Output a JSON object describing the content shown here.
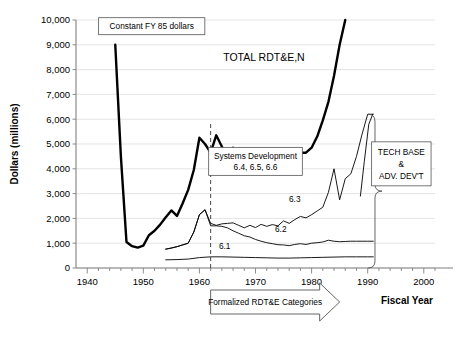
{
  "chart_data": {
    "type": "line",
    "title": "",
    "xlabel": "Fiscal Year",
    "ylabel": "Dollars (millions)",
    "xlim": [
      1938,
      2002
    ],
    "ylim": [
      0,
      10000
    ],
    "grid": true,
    "legend_position": "none",
    "xticks": [
      1940,
      1950,
      1960,
      1970,
      1980,
      1990,
      2000
    ],
    "xtick_labels": [
      "1940",
      "1950",
      "1960",
      "1970",
      "1980",
      "1990",
      "2000"
    ],
    "minor_xtick_interval": 2,
    "yticks": [
      0,
      1000,
      2000,
      3000,
      4000,
      5000,
      6000,
      7000,
      8000,
      9000,
      10000
    ],
    "ytick_labels": [
      "0",
      "1,000",
      "2,000",
      "3,000",
      "4,000",
      "5,000",
      "6,000",
      "7,000",
      "8,000",
      "9,000",
      "10,000"
    ],
    "annotations": [
      {
        "name": "constant-dollars-note",
        "text": "Constant FY 85 dollars",
        "x": 1951.5,
        "y": 9750
      },
      {
        "name": "total-series-label",
        "text": "TOTAL RDT&E,N",
        "x": 1971.5,
        "y": 8330
      },
      {
        "name": "systems-development-note",
        "text_line1": "Systems Development",
        "text_line2": "6.4, 6.5, 6.6",
        "x": 1970.0,
        "y": 4300
      },
      {
        "name": "tech-base-note",
        "text_line1": "TECH BASE",
        "text_line2": "&",
        "text_line3": "ADV. DEV'T",
        "x": 1996.0,
        "y": 4200
      },
      {
        "name": "formalized-categories-arrow",
        "text": "Formalized RDT&E Categories",
        "x": 1969.0,
        "y": -1100
      },
      {
        "name": "series-label-6-1",
        "text": "6.1",
        "x": 1964.5,
        "y": 780
      },
      {
        "name": "series-label-6-2",
        "text": "6.2",
        "x": 1974.5,
        "y": 1450
      },
      {
        "name": "series-label-6-3",
        "text": "6.3",
        "x": 1977.0,
        "y": 2680
      }
    ],
    "series": [
      {
        "name": "TOTAL RDT&E,N",
        "style": "thick",
        "x": [
          1945,
          1946,
          1947,
          1948,
          1949,
          1950,
          1951,
          1952,
          1953,
          1954,
          1955,
          1956,
          1957,
          1958,
          1959,
          1960,
          1961,
          1962,
          1963,
          1964,
          1965,
          1966,
          1967,
          1968,
          1969,
          1970,
          1971,
          1972,
          1973,
          1974,
          1975,
          1976,
          1977,
          1978,
          1979,
          1980,
          1981,
          1982,
          1983,
          1984,
          1985,
          1986
        ],
        "y": [
          9000,
          4500,
          1050,
          880,
          820,
          900,
          1320,
          1500,
          1750,
          2050,
          2320,
          2100,
          2600,
          3150,
          3950,
          5250,
          5000,
          4650,
          5350,
          4900,
          4500,
          4850,
          4200,
          4300,
          3900,
          4200,
          4300,
          4400,
          4250,
          4150,
          4200,
          4250,
          4500,
          4650,
          4650,
          4850,
          5300,
          5950,
          6700,
          7750,
          9000,
          10000
        ]
      },
      {
        "name": "6.3",
        "style": "thin",
        "x": [
          1954,
          1955,
          1956,
          1957,
          1958,
          1959,
          1960,
          1961,
          1962,
          1963,
          1964,
          1965,
          1966,
          1967,
          1968,
          1969,
          1970,
          1971,
          1972,
          1973,
          1974,
          1975,
          1976,
          1977,
          1978,
          1979,
          1980,
          1981,
          1982,
          1983,
          1984,
          1985,
          1986,
          1987,
          1988,
          1989,
          1990,
          1991
        ],
        "y": [
          760,
          800,
          860,
          930,
          1000,
          1450,
          2150,
          2350,
          1800,
          1720,
          1780,
          1800,
          1820,
          1720,
          1620,
          1720,
          1630,
          1760,
          1680,
          1750,
          1700,
          1900,
          1800,
          1950,
          2080,
          2020,
          2150,
          2300,
          2450,
          3050,
          4000,
          2750,
          3600,
          3800,
          4500,
          5400,
          6200,
          6200
        ]
      },
      {
        "name": "6.2",
        "style": "thin",
        "x": [
          1954,
          1956,
          1958,
          1959,
          1960,
          1961,
          1962,
          1963,
          1964,
          1965,
          1966,
          1967,
          1968,
          1969,
          1970,
          1971,
          1972,
          1973,
          1974,
          1975,
          1976,
          1977,
          1978,
          1979,
          1980,
          1981,
          1982,
          1983,
          1984,
          1985,
          1986,
          1987,
          1988,
          1989,
          1990,
          1991
        ],
        "y": [
          760,
          860,
          1000,
          1450,
          2150,
          2350,
          1700,
          1700,
          1680,
          1620,
          1500,
          1400,
          1300,
          1250,
          1150,
          1080,
          1020,
          980,
          940,
          930,
          900,
          950,
          980,
          950,
          1000,
          1020,
          1050,
          1120,
          1080,
          1060,
          1070,
          1080,
          1080,
          1080,
          1080,
          1080
        ]
      },
      {
        "name": "6.1",
        "style": "thin",
        "x": [
          1954,
          1956,
          1958,
          1960,
          1962,
          1964,
          1966,
          1968,
          1970,
          1972,
          1974,
          1976,
          1978,
          1980,
          1982,
          1984,
          1986,
          1988,
          1990,
          1991
        ],
        "y": [
          330,
          340,
          360,
          420,
          450,
          450,
          440,
          430,
          420,
          410,
          400,
          400,
          410,
          420,
          430,
          440,
          450,
          450,
          450,
          450
        ]
      },
      {
        "name": "tech-base-spike",
        "style": "thin",
        "x": [
          1988.7,
          1989.4,
          1990.2,
          1990.9
        ],
        "y": [
          2900,
          4300,
          5800,
          6200
        ]
      }
    ],
    "marker_lines": [
      {
        "name": "formalized-categories-divider",
        "x": 1962,
        "y_from": 0,
        "y_to": 5900,
        "style": "dashed"
      }
    ]
  }
}
